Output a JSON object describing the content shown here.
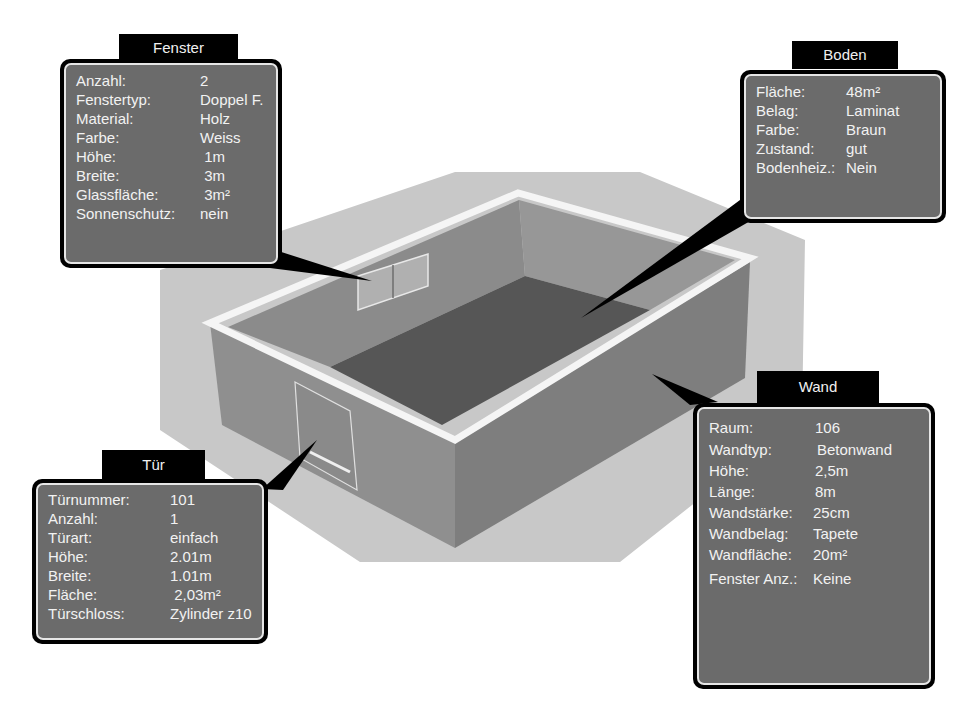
{
  "colors": {
    "panel_bg": "#6b6b6b",
    "panel_border": "#000000",
    "panel_inner_border": "#e6e6e6",
    "ground": "#c6c6c6",
    "wall_outer_left": "#8e8e8e",
    "wall_outer_right": "#7d7d7d",
    "wall_inner": "#8a8a8a",
    "floor": "#555555",
    "wall_top": "#f4f4f4"
  },
  "panels": {
    "fenster": {
      "title": "Fenster",
      "rows": [
        {
          "key": "Anzahl:",
          "value": "2"
        },
        {
          "key": "Fenstertyp:",
          "value": "Doppel F."
        },
        {
          "key": "Material:",
          "value": "Holz"
        },
        {
          "key": "Farbe:",
          "value": "Weiss"
        },
        {
          "key": "Höhe:",
          "value": " 1m"
        },
        {
          "key": "Breite:",
          "value": " 3m"
        },
        {
          "key": "Glassfläche:",
          "value": " 3m²"
        },
        {
          "key": "Sonnenschutz:",
          "value": "nein"
        }
      ]
    },
    "boden": {
      "title": "Boden",
      "rows": [
        {
          "key": "Fläche:",
          "value": "48m²"
        },
        {
          "key": "Belag:",
          "value": "Laminat"
        },
        {
          "key": "Farbe:",
          "value": "Braun"
        },
        {
          "key": "Zustand:",
          "value": "gut"
        },
        {
          "key": "Bodenheiz.:",
          "value": "Nein"
        }
      ]
    },
    "wand": {
      "title": "Wand",
      "rows": [
        {
          "key": "Raum:",
          "value": "106"
        },
        {
          "key": "Wandtyp:",
          "value": "Betonwand"
        },
        {
          "key": "Höhe:",
          "value": "2,5m"
        },
        {
          "key": "Länge:",
          "value": "8m"
        },
        {
          "key": "Wandstärke:",
          "value": "25cm"
        },
        {
          "key": "Wandbelag:",
          "value": "Tapete"
        },
        {
          "key": "Wandfläche:",
          "value": "20m²"
        },
        {
          "key": "Fenster Anz.:",
          "value": "Keine"
        }
      ]
    },
    "tuer": {
      "title": "Tür",
      "rows": [
        {
          "key": "Türnummer:",
          "value": "101"
        },
        {
          "key": "Anzahl:",
          "value": "1"
        },
        {
          "key": "Türart:",
          "value": "einfach"
        },
        {
          "key": "Höhe:",
          "value": "2.01m"
        },
        {
          "key": "Breite:",
          "value": "1.01m"
        },
        {
          "key": "Fläche:",
          "value": " 2,03m²"
        },
        {
          "key": "Türschloss:",
          "value": "Zylinder z10"
        }
      ]
    }
  }
}
